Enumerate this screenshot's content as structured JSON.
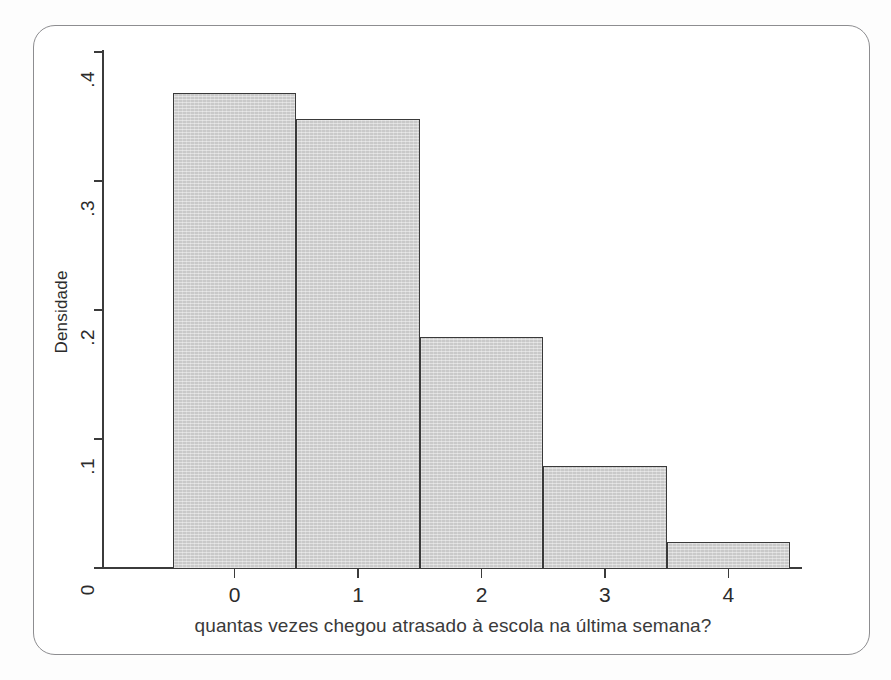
{
  "figure": {
    "frame_border_color": "#8d8d90",
    "background_color": "#ffffff"
  },
  "chart_data": {
    "type": "bar",
    "subtype": "histogram",
    "title": "",
    "subtitle": "",
    "xlabel": "quantas vezes chegou atrasado à escola na última semana?",
    "ylabel": "Densidade",
    "categories": [
      "0",
      "1",
      "2",
      "3",
      "4"
    ],
    "values": [
      0.368,
      0.348,
      0.179,
      0.079,
      0.02
    ],
    "x": [
      0,
      1,
      2,
      3,
      4
    ],
    "bin_width": 1,
    "bin_edges": [
      -0.5,
      0.5,
      1.5,
      2.5,
      3.5,
      4.5
    ],
    "xlim": [
      -0.5,
      4.5
    ],
    "ylim": [
      0,
      0.4
    ],
    "ytick_labels": [
      ".4",
      ".3",
      ".2",
      ".1",
      "0"
    ],
    "ytick_values": [
      0.4,
      0.3,
      0.2,
      0.1,
      0
    ],
    "xtick_labels": [
      "0",
      "1",
      "2",
      "3",
      "4"
    ],
    "xtick_values": [
      0,
      1,
      2,
      3,
      4
    ],
    "grid": false,
    "legend": null,
    "legend_position": "none",
    "bar_fill_color": "#c9c9c9",
    "bar_edge_color": "#3a3a3a",
    "axis_color": "#3b3b3b"
  }
}
